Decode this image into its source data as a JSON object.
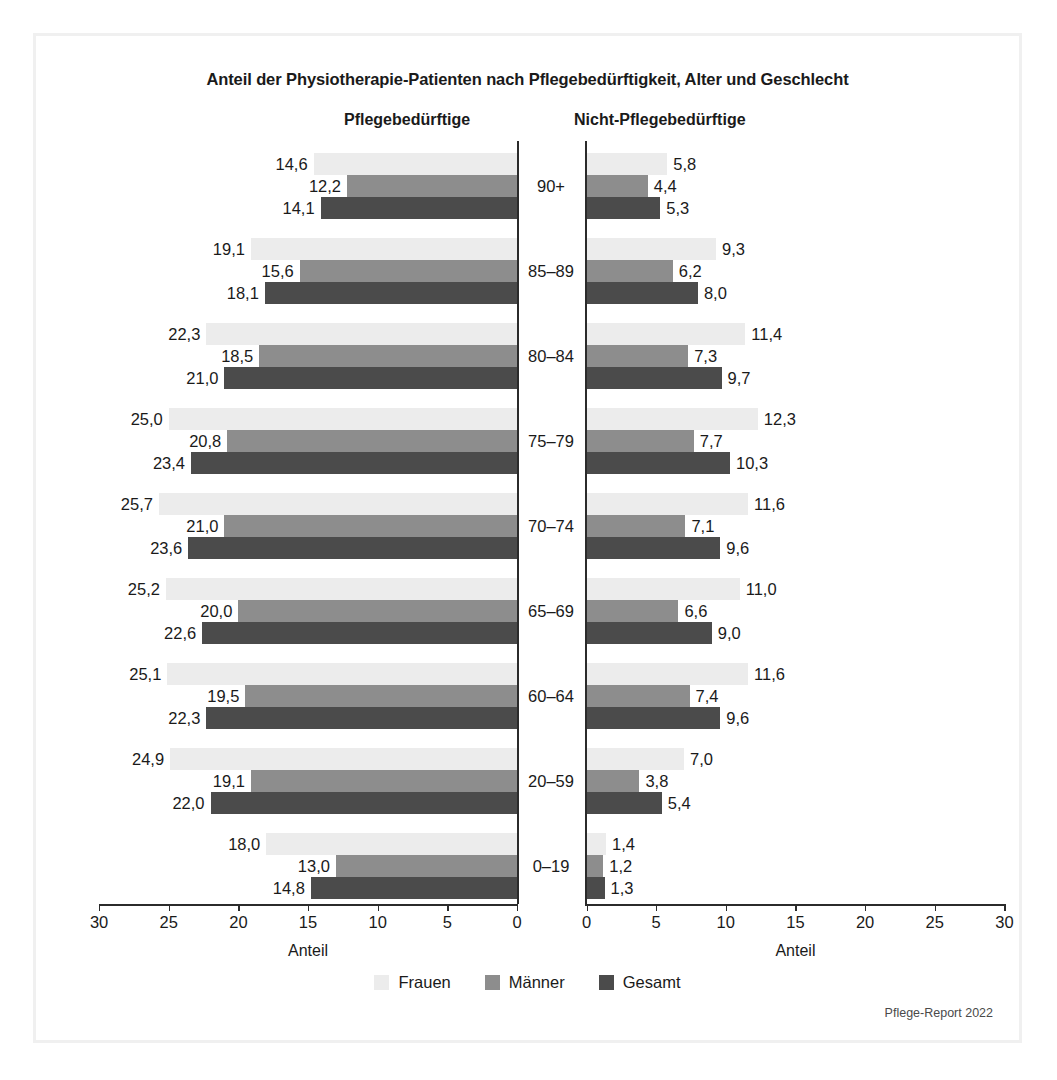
{
  "title": "Anteil der Physiotherapie-Patienten nach Pflegebedürftigkeit, Alter und Geschlecht",
  "panels": {
    "left_header": "Pflegebedürftige",
    "right_header": "Nicht-Pflegebedürftige"
  },
  "axis_title": "Anteil",
  "source": "Pflege-Report 2022",
  "legend": [
    {
      "label": "Frauen",
      "color": "#ececec",
      "key": "frauen"
    },
    {
      "label": "Männer",
      "color": "#8d8d8d",
      "key": "maenner"
    },
    {
      "label": "Gesamt",
      "color": "#4b4b4b",
      "key": "gesamt"
    }
  ],
  "chart_data": {
    "type": "bar",
    "orientation": "horizontal",
    "layout": "back-to-back-pyramid",
    "title": "Anteil der Physiotherapie-Patienten nach Pflegebedürftigkeit, Alter und Geschlecht",
    "xlabel": "Anteil",
    "ylabel": "",
    "grid": false,
    "legend_position": "bottom-center",
    "categories": [
      "90+",
      "85–89",
      "80–84",
      "75–79",
      "70–74",
      "65–69",
      "60–64",
      "20–59",
      "0–19"
    ],
    "panels": [
      {
        "name": "Pflegebedürftige",
        "direction": "left",
        "xlim": [
          0,
          30
        ],
        "xticks": [
          30,
          25,
          20,
          15,
          10,
          5,
          0
        ],
        "xticklabels": [
          "30",
          "25",
          "20",
          "15",
          "10",
          "5",
          "0"
        ],
        "series": [
          {
            "name": "Frauen",
            "color": "#ececec",
            "values": [
              14.6,
              19.1,
              22.3,
              25.0,
              25.7,
              25.2,
              25.1,
              24.9,
              18.0
            ],
            "labels": [
              "14,6",
              "19,1",
              "22,3",
              "25,0",
              "25,7",
              "25,2",
              "25,1",
              "24,9",
              "18,0"
            ]
          },
          {
            "name": "Männer",
            "color": "#8d8d8d",
            "values": [
              12.2,
              15.6,
              18.5,
              20.8,
              21.0,
              20.0,
              19.5,
              19.1,
              13.0
            ],
            "labels": [
              "12,2",
              "15,6",
              "18,5",
              "20,8",
              "21,0",
              "20,0",
              "19,5",
              "19,1",
              "13,0"
            ]
          },
          {
            "name": "Gesamt",
            "color": "#4b4b4b",
            "values": [
              14.1,
              18.1,
              21.0,
              23.4,
              23.6,
              22.6,
              22.3,
              22.0,
              14.8
            ],
            "labels": [
              "14,1",
              "18,1",
              "21,0",
              "23,4",
              "23,6",
              "22,6",
              "22,3",
              "22,0",
              "14,8"
            ]
          }
        ]
      },
      {
        "name": "Nicht-Pflegebedürftige",
        "direction": "right",
        "xlim": [
          0,
          30
        ],
        "xticks": [
          0,
          5,
          10,
          15,
          20,
          25,
          30
        ],
        "xticklabels": [
          "0",
          "5",
          "10",
          "15",
          "20",
          "25",
          "30"
        ],
        "series": [
          {
            "name": "Frauen",
            "color": "#ececec",
            "values": [
              5.8,
              9.3,
              11.4,
              12.3,
              11.6,
              11.0,
              11.6,
              7.0,
              1.4
            ],
            "labels": [
              "5,8",
              "9,3",
              "11,4",
              "12,3",
              "11,6",
              "11,0",
              "11,6",
              "7,0",
              "1,4"
            ]
          },
          {
            "name": "Männer",
            "color": "#8d8d8d",
            "values": [
              4.4,
              6.2,
              7.3,
              7.7,
              7.1,
              6.6,
              7.4,
              3.8,
              1.2
            ],
            "labels": [
              "4,4",
              "6,2",
              "7,3",
              "7,7",
              "7,1",
              "6,6",
              "7,4",
              "3,8",
              "1,2"
            ]
          },
          {
            "name": "Gesamt",
            "color": "#4b4b4b",
            "values": [
              5.3,
              8.0,
              9.7,
              10.3,
              9.6,
              9.0,
              9.6,
              5.4,
              1.3
            ],
            "labels": [
              "5,3",
              "8,0",
              "9,7",
              "10,3",
              "9,6",
              "9,0",
              "9,6",
              "5,4",
              "1,3"
            ]
          }
        ]
      }
    ]
  }
}
